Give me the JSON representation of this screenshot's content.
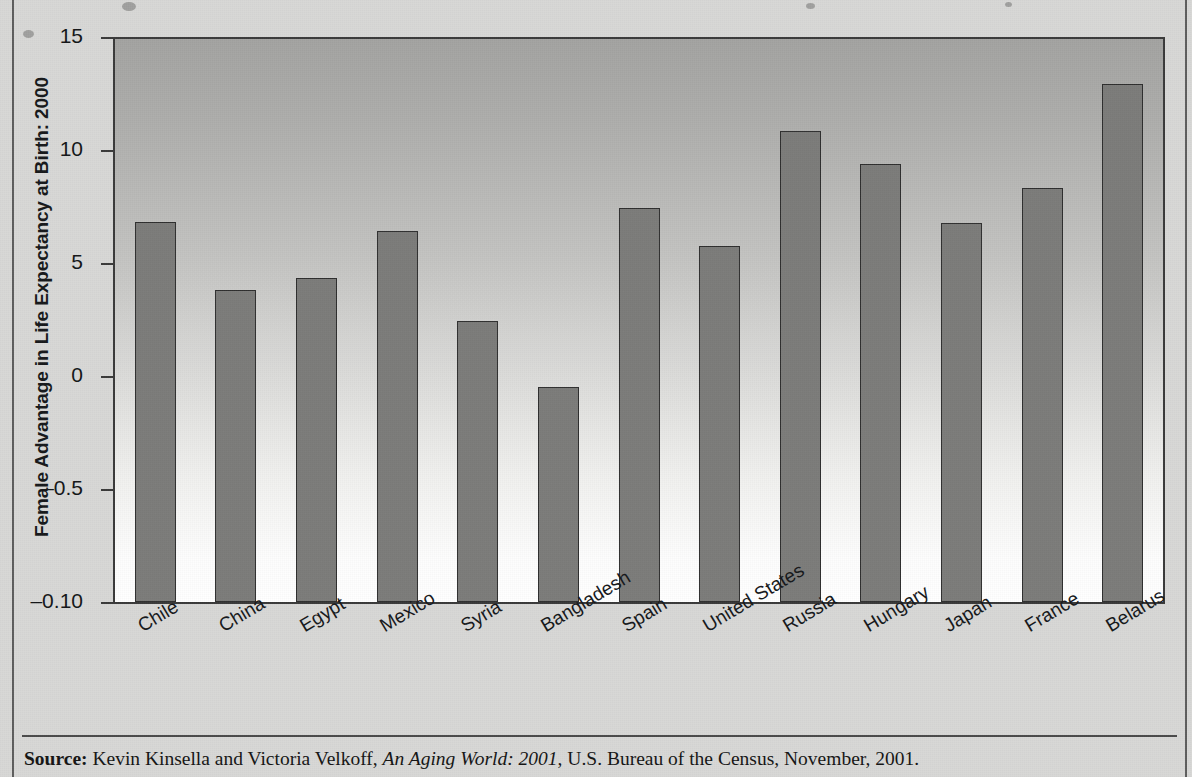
{
  "chart_data": {
    "type": "bar",
    "title": "",
    "xlabel": "",
    "ylabel": "Female Advantage in Life Expectancy at Birth: 2000",
    "categories": [
      "Chile",
      "China",
      "Egypt",
      "Mexico",
      "Syria",
      "Bangladesh",
      "Spain",
      "United States",
      "Russia",
      "Hungary",
      "Japan",
      "France",
      "Belarus"
    ],
    "values": [
      6.8,
      3.8,
      4.35,
      6.4,
      2.45,
      -0.5,
      7.45,
      5.75,
      10.85,
      9.4,
      6.75,
      8.3,
      12.9
    ],
    "ytick_labels": [
      "15",
      "10",
      "5",
      "0",
      "–0.5",
      "–0.10"
    ],
    "ytick_values": [
      15,
      10,
      5,
      0,
      -5,
      -10
    ],
    "ylim": [
      -10,
      15
    ],
    "grid": false,
    "legend": "none",
    "bar_color": "#7b7b79",
    "bar_border_color": "#2f2f2f",
    "plot_background": "vertical gradient gray to white",
    "note": "Bars are drawn from the bottom axis baseline; y tick labels below zero read -0.5 and -0.10 as printed in the original."
  },
  "source": {
    "label": "Source:",
    "authors": " Kevin Kinsella and Victoria Velkoff, ",
    "work": "An Aging World: 2001",
    "publisher": ", U.S. Bureau of the Census, November, 2001."
  }
}
